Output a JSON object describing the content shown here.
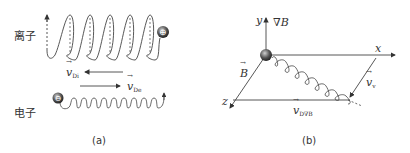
{
  "panel_a": {
    "ion_label": "离子",
    "electron_label": "电子",
    "ion_drift_label": "v",
    "ion_drift_sub": "Di",
    "electron_drift_label": "v",
    "electron_drift_sub": "De",
    "ion_charge": "+",
    "electron_charge": "−",
    "caption": "(a)"
  },
  "panel_b": {
    "y_axis": "y",
    "grad_b": "∇B",
    "x_axis": "x",
    "z_axis": "z",
    "b_field": "B",
    "velocity_label": "v",
    "velocity_sub": "v",
    "drift_label": "v",
    "drift_sub": "D∇B",
    "caption": "(b)"
  }
}
